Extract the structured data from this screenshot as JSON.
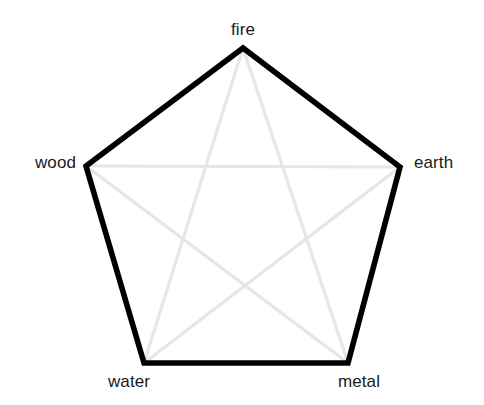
{
  "diagram": {
    "type": "pentagram",
    "background_color": "#ffffff",
    "pentagon_stroke_color": "#000000",
    "pentagon_stroke_width": 5.6,
    "star_stroke_color": "#e6e6e6",
    "star_stroke_width": 3.2,
    "label_color": "#1a1a1a",
    "label_font_size": 17,
    "nodes": [
      {
        "id": "fire",
        "label": "fire",
        "x": 243,
        "y": 48,
        "label_position": "top"
      },
      {
        "id": "earth",
        "label": "earth",
        "x": 400,
        "y": 167,
        "label_position": "right"
      },
      {
        "id": "metal",
        "label": "metal",
        "x": 348,
        "y": 363,
        "label_position": "bottom-right"
      },
      {
        "id": "water",
        "label": "water",
        "x": 144,
        "y": 363,
        "label_position": "bottom-left"
      },
      {
        "id": "wood",
        "label": "wood",
        "x": 86,
        "y": 166,
        "label_position": "left"
      }
    ],
    "pentagon_edges": [
      {
        "from": "fire",
        "to": "earth"
      },
      {
        "from": "earth",
        "to": "metal"
      },
      {
        "from": "metal",
        "to": "water"
      },
      {
        "from": "water",
        "to": "wood"
      },
      {
        "from": "wood",
        "to": "fire"
      }
    ],
    "star_edges": [
      {
        "from": "fire",
        "to": "metal"
      },
      {
        "from": "metal",
        "to": "wood"
      },
      {
        "from": "wood",
        "to": "earth"
      },
      {
        "from": "earth",
        "to": "water"
      },
      {
        "from": "water",
        "to": "fire"
      }
    ]
  },
  "labels": {
    "fire": "fire",
    "earth": "earth",
    "metal": "metal",
    "water": "water",
    "wood": "wood"
  }
}
